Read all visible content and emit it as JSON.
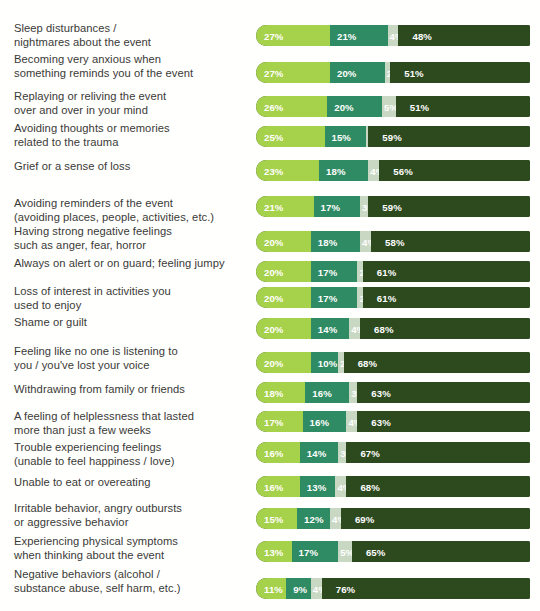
{
  "chart_data": {
    "type": "bar",
    "subtype": "horizontal-stacked",
    "title": "",
    "subtitle": "",
    "xlabel": "",
    "ylabel": "",
    "xlim": [
      0,
      100
    ],
    "grid": false,
    "legend": "none",
    "orientation": "horizontal",
    "value_suffix": "%",
    "categories": [
      "Sleep disturbances /\nnightmares about the event",
      "Becoming very anxious when\nsomething reminds you of the event",
      "Replaying or reliving the event\nover and over in your mind",
      "Avoiding thoughts or memories\nrelated to the trauma",
      "Grief or a sense of loss",
      "Avoiding reminders of the event\n(avoiding places, people, activities, etc.)",
      "Having strong negative feelings\nsuch as anger, fear, horror",
      "Always on alert or on guard; feeling jumpy",
      "Loss of interest in activities you\nused to enjoy",
      "Shame or guilt",
      "Feeling like no one is listening to\nyou / you've lost your voice",
      "Withdrawing from family or friends",
      "A feeling of helplessness that lasted\nmore than just a few weeks",
      "Trouble experiencing feelings\n(unable to feel happiness / love)",
      "Unable to eat or overeating",
      "Irritable behavior, angry outbursts\nor aggressive behavior",
      "Experiencing physical symptoms\nwhen thinking about the event",
      "Negative behaviors (alcohol /\nsubstance abuse, self harm, etc.)"
    ],
    "series": [
      {
        "name": "segment-1",
        "color": "#a6d14b",
        "values": [
          27,
          27,
          26,
          25,
          23,
          21,
          20,
          20,
          20,
          20,
          20,
          18,
          17,
          16,
          16,
          15,
          13,
          11
        ]
      },
      {
        "name": "segment-2",
        "color": "#2f8b63",
        "values": [
          21,
          20,
          20,
          15,
          18,
          17,
          18,
          17,
          17,
          14,
          10,
          16,
          16,
          14,
          13,
          12,
          17,
          9
        ]
      },
      {
        "name": "segment-3",
        "color": "#c9d8c2",
        "values": [
          4,
          2,
          5,
          1,
          4,
          3,
          4,
          2,
          2,
          4,
          2,
          3,
          4,
          3,
          4,
          4,
          5,
          4
        ]
      },
      {
        "name": "segment-4",
        "color": "#2d4a1f",
        "values": [
          48,
          51,
          51,
          59,
          56,
          59,
          58,
          61,
          61,
          68,
          68,
          63,
          63,
          67,
          68,
          69,
          65,
          76
        ]
      }
    ],
    "rows": [
      {
        "label": "Sleep disturbances /\nnightmares about the event",
        "values": [
          27,
          21,
          4,
          48
        ],
        "labels": [
          "27%",
          "21%",
          "4%",
          "48%"
        ]
      },
      {
        "label": "Becoming very anxious when\nsomething reminds you of the event",
        "values": [
          27,
          20,
          2,
          51
        ],
        "labels": [
          "27%",
          "20%",
          "2%",
          "51%"
        ]
      },
      {
        "label": "Replaying or reliving the event\nover and over in your mind",
        "values": [
          26,
          20,
          5,
          51
        ],
        "labels": [
          "26%",
          "20%",
          "5%",
          "51%"
        ]
      },
      {
        "label": "Avoiding thoughts or memories\nrelated to the trauma",
        "values": [
          25,
          15,
          1,
          59
        ],
        "labels": [
          "25%",
          "15%",
          "1%",
          "59%"
        ]
      },
      {
        "label": "Grief or a sense of loss",
        "values": [
          23,
          18,
          4,
          56
        ],
        "labels": [
          "23%",
          "18%",
          "4%",
          "56%"
        ]
      },
      {
        "label": "Avoiding reminders of the event\n(avoiding places, people, activities, etc.)",
        "values": [
          21,
          17,
          3,
          59
        ],
        "labels": [
          "21%",
          "17%",
          "3%",
          "59%"
        ]
      },
      {
        "label": "Having strong negative feelings\nsuch as anger, fear, horror",
        "values": [
          20,
          18,
          4,
          58
        ],
        "labels": [
          "20%",
          "18%",
          "4%",
          "58%"
        ]
      },
      {
        "label": "Always on alert or on guard; feeling jumpy",
        "values": [
          20,
          17,
          2,
          61
        ],
        "labels": [
          "20%",
          "17%",
          "2%",
          "61%"
        ]
      },
      {
        "label": "Loss of interest in activities you\nused to enjoy",
        "values": [
          20,
          17,
          2,
          61
        ],
        "labels": [
          "20%",
          "17%",
          "2%",
          "61%"
        ]
      },
      {
        "label": "Shame or guilt",
        "values": [
          20,
          14,
          4,
          68
        ],
        "labels": [
          "20%",
          "14%",
          "4%",
          "68%"
        ]
      },
      {
        "label": "Feeling like no one is listening to\nyou / you've lost your voice",
        "values": [
          20,
          10,
          2,
          68
        ],
        "labels": [
          "20%",
          "10%",
          "2%",
          "68%"
        ]
      },
      {
        "label": "Withdrawing from family or friends",
        "values": [
          18,
          16,
          3,
          63
        ],
        "labels": [
          "18%",
          "16%",
          "3%",
          "63%"
        ]
      },
      {
        "label": "A feeling of helplessness that lasted\nmore than just a few weeks",
        "values": [
          17,
          16,
          4,
          63
        ],
        "labels": [
          "17%",
          "16%",
          "4%",
          "63%"
        ]
      },
      {
        "label": "Trouble experiencing feelings\n(unable to feel happiness / love)",
        "values": [
          16,
          14,
          3,
          67
        ],
        "labels": [
          "16%",
          "14%",
          "3%",
          "67%"
        ]
      },
      {
        "label": "Unable to eat or overeating",
        "values": [
          16,
          13,
          4,
          68
        ],
        "labels": [
          "16%",
          "13%",
          "4%",
          "68%"
        ]
      },
      {
        "label": "Irritable behavior, angry outbursts\nor aggressive behavior",
        "values": [
          15,
          12,
          4,
          69
        ],
        "labels": [
          "15%",
          "12%",
          "4%",
          "69%"
        ]
      },
      {
        "label": "Experiencing physical symptoms\nwhen thinking about the event",
        "values": [
          13,
          17,
          5,
          65
        ],
        "labels": [
          "13%",
          "17%",
          "5%",
          "65%"
        ]
      },
      {
        "label": "Negative behaviors (alcohol /\nsubstance abuse, self harm, etc.)",
        "values": [
          11,
          9,
          4,
          76
        ],
        "labels": [
          "11%",
          "9%",
          "4%",
          "76%"
        ]
      }
    ],
    "colors": {
      "segment_1": "#a6d14b",
      "segment_2": "#2f8b63",
      "segment_3": "#c9d8c2",
      "segment_4": "#2d4a1f",
      "background": "#fffffd",
      "label_text": "#3a3a38",
      "value_text": "#ffffff"
    }
  },
  "layout": {
    "bar_left_px": 256,
    "bar_width_px": 274,
    "bar_height_px": 21,
    "label_left_px": 14,
    "label_width_px": 236,
    "row_tops_px": [
      25,
      62,
      96,
      126,
      160,
      196,
      231,
      261,
      287,
      318,
      352,
      382,
      411,
      442,
      476,
      508,
      541,
      578
    ],
    "label_tops_px": [
      22,
      53,
      90,
      122,
      160,
      197,
      225,
      257,
      285,
      316,
      345,
      383,
      410,
      441,
      476,
      502,
      535,
      568
    ]
  }
}
